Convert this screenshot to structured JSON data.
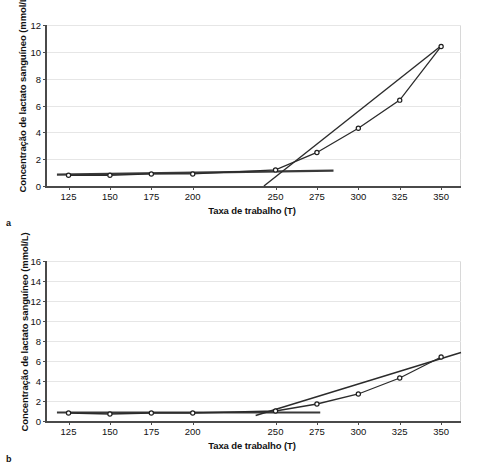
{
  "figures": [
    {
      "panel_label": "a",
      "chart_data": {
        "type": "line",
        "title": "",
        "xlabel": "Taxa de trabalho (T)",
        "ylabel": "Concentração de lactato sanguíneo (mmol/L)",
        "xlim": [
          112,
          362
        ],
        "ylim": [
          0,
          12
        ],
        "yticks": [
          0,
          2,
          4,
          6,
          8,
          10,
          12
        ],
        "xticks": [
          125,
          150,
          175,
          200,
          250,
          275,
          300,
          325,
          350
        ],
        "xtick_labels": [
          "125",
          "150",
          "175",
          "200",
          "250",
          "275",
          "300",
          "325",
          "350"
        ],
        "grid": true,
        "legend": "none",
        "x": [
          125,
          150,
          175,
          200,
          250,
          275,
          300,
          325,
          350
        ],
        "series": [
          {
            "name": "Concentração de lactato sanguíneo",
            "values": [
              0.8,
              0.8,
              0.9,
              0.9,
              1.2,
              2.5,
              4.3,
              6.4,
              10.4
            ]
          }
        ],
        "annotations": [
          {
            "name": "baseline-tangent",
            "type": "segment",
            "x": [
              118,
              285
            ],
            "y": [
              0.85,
              1.15
            ]
          },
          {
            "name": "threshold-tangent",
            "type": "segment",
            "x": [
              243,
              351
            ],
            "y": [
              0.0,
              10.55
            ]
          }
        ]
      }
    },
    {
      "panel_label": "b",
      "chart_data": {
        "type": "line",
        "title": "",
        "xlabel": "Taxa de trabalho (T)",
        "ylabel": "Concentração de lactato sanguíneo (mmol/L)",
        "xlim": [
          112,
          362
        ],
        "ylim": [
          0,
          16
        ],
        "yticks": [
          0,
          2,
          4,
          6,
          8,
          10,
          12,
          14,
          16
        ],
        "xticks": [
          125,
          150,
          175,
          200,
          250,
          275,
          300,
          325,
          350
        ],
        "xtick_labels": [
          "125",
          "150",
          "175",
          "200",
          "250",
          "275",
          "300",
          "325",
          "350"
        ],
        "grid": true,
        "legend": "none",
        "x": [
          125,
          150,
          175,
          200,
          250,
          275,
          300,
          325,
          350
        ],
        "series": [
          {
            "name": "Concentração de lactato sanguíneo",
            "values": [
              0.8,
              0.7,
              0.8,
              0.8,
              1.0,
              1.7,
              2.7,
              4.3,
              6.4
            ]
          }
        ],
        "annotations": [
          {
            "name": "baseline-tangent",
            "type": "segment",
            "x": [
              118,
              277
            ],
            "y": [
              0.85,
              0.85
            ]
          },
          {
            "name": "threshold-tangent",
            "type": "segment",
            "x": [
              238,
              362
            ],
            "y": [
              0.55,
              6.85
            ]
          }
        ]
      }
    }
  ]
}
